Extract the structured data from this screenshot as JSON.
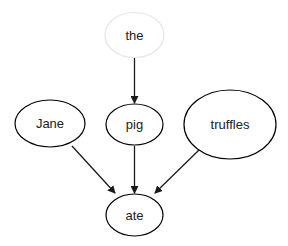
{
  "diagram": {
    "type": "directed-graph",
    "nodes": [
      {
        "id": "the",
        "label": "the",
        "cx": 134.5,
        "cy": 35,
        "rx": 29.5,
        "ry": 22.5,
        "stroke": "#e6e6e6"
      },
      {
        "id": "jane",
        "label": "Jane",
        "cx": 50,
        "cy": 123.5,
        "rx": 35,
        "ry": 23.5,
        "stroke": "#000000"
      },
      {
        "id": "pig",
        "label": "pig",
        "cx": 134.5,
        "cy": 124.5,
        "rx": 28.5,
        "ry": 20.5,
        "stroke": "#000000"
      },
      {
        "id": "truffles",
        "label": "truffles",
        "cx": 230,
        "cy": 124.5,
        "rx": 46,
        "ry": 34.5,
        "stroke": "#000000"
      },
      {
        "id": "ate",
        "label": "ate",
        "cx": 134.5,
        "cy": 215,
        "rx": 28.5,
        "ry": 21,
        "stroke": "#000000"
      }
    ],
    "edges": [
      {
        "from": "the",
        "to": "pig",
        "x1": 134.5,
        "y1": 58,
        "x2": 134.5,
        "y2": 103
      },
      {
        "from": "jane",
        "to": "ate",
        "x1": 72,
        "y1": 146,
        "x2": 115,
        "y2": 193
      },
      {
        "from": "pig",
        "to": "ate",
        "x1": 134.5,
        "y1": 146,
        "x2": 134.5,
        "y2": 193
      },
      {
        "from": "truffles",
        "to": "ate",
        "x1": 199,
        "y1": 150,
        "x2": 155,
        "y2": 193
      }
    ],
    "colors": {
      "edge": "#1a1a1a",
      "node_fill": "#ffffff",
      "text": "#222222"
    }
  }
}
